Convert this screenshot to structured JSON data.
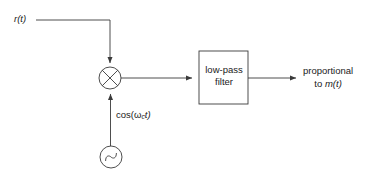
{
  "diagram": {
    "stroke_color": "#3a3a3a",
    "text_color": "#1a1a1a",
    "background_color": "#ffffff",
    "labels": {
      "input_signal": "r(t)",
      "carrier_prefix": "cos(ω",
      "carrier_subscript": "c",
      "carrier_suffix": "t)",
      "filter_line1": "low-pass",
      "filter_line2": "filter",
      "output_line1": "proportional",
      "output_line2_prefix": "to ",
      "output_line2_signal": "m(t)"
    },
    "blocks": {
      "multiplier": {
        "name": "multiplier",
        "symbol": "cross-in-circle",
        "cx": 110,
        "cy": 78,
        "r": 11
      },
      "oscillator": {
        "name": "local-oscillator",
        "symbol": "sine-wave-in-circle",
        "cx": 111,
        "cy": 157,
        "r": 11
      },
      "lowpass_filter": {
        "name": "low-pass-filter",
        "x": 199,
        "y": 51,
        "width": 49,
        "height": 53
      }
    },
    "connections": [
      {
        "name": "input-to-multiplier",
        "from": "r(t)",
        "to": "multiplier"
      },
      {
        "name": "oscillator-to-multiplier",
        "from": "local oscillator",
        "to": "multiplier"
      },
      {
        "name": "multiplier-to-filter",
        "from": "multiplier",
        "to": "low-pass filter"
      },
      {
        "name": "filter-to-output",
        "from": "low-pass filter",
        "to": "proportional to m(t)"
      }
    ]
  }
}
